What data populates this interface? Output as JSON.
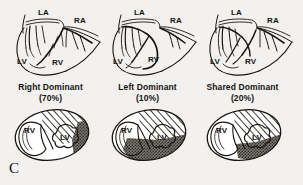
{
  "figure": {
    "panel_letter": "C",
    "background_color": "#f2f1ef",
    "ink_color": "#17150f"
  },
  "legend_textures": {
    "hatched": {
      "name": "hatched-territory",
      "meaning": "Left anterior descending / anterior territory",
      "color": "#ffffff",
      "line_color": "#1a1814"
    },
    "stippled": {
      "name": "stippled-territory",
      "meaning": "Dominant coronary artery territory",
      "color": "#6e6a63"
    },
    "blank": {
      "name": "blank-territory",
      "color": "#ffffff"
    }
  },
  "panels": [
    {
      "id": "right-dominant",
      "caption": "Right Dominant",
      "percent": "(70%)",
      "top_labels": {
        "la": "LA",
        "ra": "RA",
        "lv": "LV",
        "rv": "RV"
      },
      "cross_labels": {
        "rv": "RV",
        "lv": "LV"
      },
      "stipple_extent": "small"
    },
    {
      "id": "left-dominant",
      "caption": "Left Dominant",
      "percent": "(10%)",
      "top_labels": {
        "la": "LA",
        "ra": "RA",
        "lv": "LV",
        "rv": "RV"
      },
      "cross_labels": {
        "rv": "RV",
        "lv": "LV"
      },
      "stipple_extent": "large"
    },
    {
      "id": "shared-dominant",
      "caption": "Shared Dominant",
      "percent": "(20%)",
      "top_labels": {
        "la": "LA",
        "ra": "RA",
        "lv": "LV",
        "rv": "RV"
      },
      "cross_labels": {
        "rv": "RV",
        "lv": "LV"
      },
      "stipple_extent": "medium"
    }
  ]
}
